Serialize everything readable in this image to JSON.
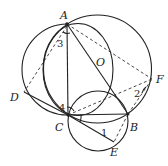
{
  "diagram": {
    "type": "geometry",
    "points": [
      {
        "id": "A",
        "label": "A",
        "x": 67,
        "y": 24,
        "lx": 60,
        "ly": 19
      },
      {
        "id": "C",
        "label": "C",
        "x": 68,
        "y": 115,
        "lx": 56,
        "ly": 131
      },
      {
        "id": "B",
        "label": "B",
        "x": 128,
        "y": 114,
        "lx": 130,
        "ly": 131
      },
      {
        "id": "O",
        "label": "O",
        "x": 97,
        "y": 69,
        "lx": 96,
        "ly": 66
      },
      {
        "id": "D",
        "label": "D",
        "x": 24,
        "y": 92,
        "lx": 10,
        "ly": 101
      },
      {
        "id": "F",
        "label": "F",
        "x": 152,
        "y": 79,
        "lx": 156,
        "ly": 83
      },
      {
        "id": "E",
        "label": "E",
        "x": 114,
        "y": 142,
        "lx": 110,
        "ly": 156
      }
    ],
    "angle_labels": [
      {
        "label": "1",
        "x": 101,
        "y": 136
      },
      {
        "label": "2",
        "x": 134,
        "y": 97
      },
      {
        "label": "3",
        "x": 57,
        "y": 47
      },
      {
        "label": "4",
        "x": 59,
        "y": 111
      }
    ],
    "circles": [
      {
        "name": "circle-O",
        "cx": 97.5,
        "cy": 69,
        "r": 54
      },
      {
        "name": "circle-AC-inner",
        "cx": 78,
        "cy": 69.5,
        "rx": 35,
        "ry": 46
      },
      {
        "name": "circle-ADC",
        "cx": 63,
        "cy": 70,
        "r": 45
      },
      {
        "name": "circle-CBE",
        "cx": 98,
        "cy": 121,
        "r": 30
      }
    ],
    "solid_segments": [
      "AC",
      "AB",
      "CB",
      "DC",
      "CE"
    ],
    "dashed_segments": [
      "AF",
      "AD",
      "CF",
      "BF",
      "BE"
    ]
  }
}
